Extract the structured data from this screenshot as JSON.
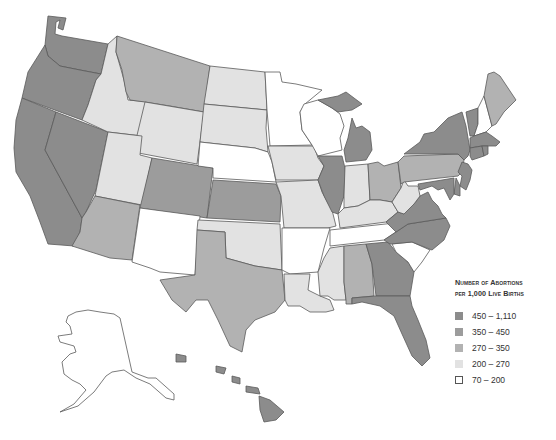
{
  "map": {
    "title": "Number of Abortions per 1,000 Live Births by State",
    "region": "United States",
    "categories": [
      {
        "key": "c5",
        "range": "450 – 1,110",
        "color": "#8c8c8c"
      },
      {
        "key": "c4",
        "range": "350 – 450",
        "color": "#9c9c9c"
      },
      {
        "key": "c3",
        "range": "270 – 350",
        "color": "#b2b2b2"
      },
      {
        "key": "c2",
        "range": "200 – 270",
        "color": "#e2e2e2"
      },
      {
        "key": "c1",
        "range": "70 – 200",
        "color": "#ffffff"
      }
    ],
    "states": {
      "WA": "c5",
      "OR": "c5",
      "CA": "c5",
      "NV": "c5",
      "ID": "c2",
      "MT": "c3",
      "WY": "c2",
      "UT": "c2",
      "AZ": "c3",
      "CO": "c4",
      "NM": "c1",
      "ND": "c2",
      "SD": "c2",
      "NE": "c1",
      "KS": "c4",
      "OK": "c2",
      "TX": "c3",
      "MN": "c1",
      "IA": "c2",
      "MO": "c2",
      "AR": "c1",
      "LA": "c2",
      "WI": "c1",
      "IL": "c5",
      "MI": "c5",
      "IN": "c2",
      "OH": "c3",
      "KY": "c2",
      "TN": "c1",
      "MS": "c2",
      "AL": "c3",
      "GA": "c5",
      "FL": "c5",
      "SC": "c1",
      "NC": "c5",
      "VA": "c5",
      "WV": "c2",
      "PA": "c3",
      "NY": "c5",
      "VT": "c5",
      "NH": "c1",
      "ME": "c3",
      "MA": "c5",
      "CT": "c5",
      "RI": "c5",
      "NJ": "c5",
      "DE": "c5",
      "MD": "c5",
      "AK": "c1",
      "HI": "c5"
    }
  },
  "legend": {
    "title_line1": "Number of Abortions",
    "title_line2": "per 1,000 Live Births",
    "items": [
      {
        "label": "450 – 1,110",
        "color": "#8c8c8c",
        "border": "#8c8c8c"
      },
      {
        "label": "350 – 450",
        "color": "#9c9c9c",
        "border": "#9c9c9c"
      },
      {
        "label": "270 – 350",
        "color": "#b2b2b2",
        "border": "#b2b2b2"
      },
      {
        "label": "200 – 270",
        "color": "#e2e2e2",
        "border": "#e2e2e2"
      },
      {
        "label": "70 – 200",
        "color": "#ffffff",
        "border": "#555555"
      }
    ]
  }
}
